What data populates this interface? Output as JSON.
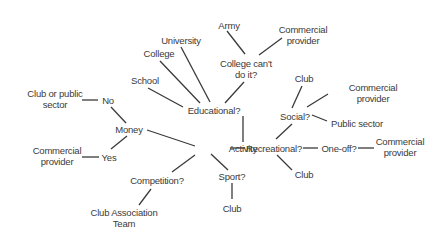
{
  "diagram": {
    "type": "mind-map",
    "root": "Activity",
    "nodes": {
      "activity": {
        "label": "Activity",
        "x": 243,
        "y": 148
      },
      "educational": {
        "label": "Educational?",
        "x": 214,
        "y": 110
      },
      "school": {
        "label": "School",
        "x": 145,
        "y": 80
      },
      "college": {
        "label": "College",
        "x": 159,
        "y": 53
      },
      "university": {
        "label": "University",
        "x": 181,
        "y": 40
      },
      "college_cant": {
        "label": "College can't\ndo it?",
        "x": 246,
        "y": 69
      },
      "army": {
        "label": "Army",
        "x": 229,
        "y": 25
      },
      "commercial_top": {
        "label": "Commercial\nprovider",
        "x": 303,
        "y": 35
      },
      "money": {
        "label": "Money",
        "x": 129,
        "y": 129
      },
      "no": {
        "label": "No",
        "x": 108,
        "y": 100
      },
      "club_public": {
        "label": "Club or public\nsector",
        "x": 55,
        "y": 99
      },
      "yes": {
        "label": "Yes",
        "x": 109,
        "y": 157
      },
      "commercial_left": {
        "label": "Commercial\nprovider",
        "x": 57,
        "y": 156
      },
      "competition": {
        "label": "Competition?",
        "x": 157,
        "y": 180
      },
      "club_assoc": {
        "label": "Club Association\nTeam",
        "x": 124,
        "y": 218
      },
      "sport": {
        "label": "Sport?",
        "x": 232,
        "y": 176
      },
      "club_sport": {
        "label": "Club",
        "x": 232,
        "y": 208
      },
      "recreational": {
        "label": "Recreational?",
        "x": 274,
        "y": 148
      },
      "club_rec": {
        "label": "Club",
        "x": 304,
        "y": 174
      },
      "oneoff": {
        "label": "One-off?",
        "x": 339,
        "y": 148
      },
      "commercial_right": {
        "label": "Commercial\nprovider",
        "x": 400,
        "y": 147
      },
      "social": {
        "label": "Social?",
        "x": 295,
        "y": 116
      },
      "club_social": {
        "label": "Club",
        "x": 304,
        "y": 78
      },
      "commercial_social": {
        "label": "Commercial provider",
        "x": 373,
        "y": 93
      },
      "public_sector": {
        "label": "Public sector",
        "x": 357,
        "y": 123
      }
    },
    "edges": [
      {
        "from": "activity",
        "to": "educational",
        "x1": 243,
        "y1": 142,
        "x2": 243,
        "y2": 116
      },
      {
        "from": "educational",
        "to": "school",
        "x1": 183,
        "y1": 107,
        "x2": 148,
        "y2": 88
      },
      {
        "from": "educational",
        "to": "college",
        "x1": 200,
        "y1": 103,
        "x2": 160,
        "y2": 61
      },
      {
        "from": "educational",
        "to": "university",
        "x1": 210,
        "y1": 102,
        "x2": 181,
        "y2": 47
      },
      {
        "from": "educational",
        "to": "college_cant",
        "x1": 225,
        "y1": 103,
        "x2": 244,
        "y2": 82
      },
      {
        "from": "college_cant",
        "to": "army",
        "x1": 245,
        "y1": 54,
        "x2": 227,
        "y2": 31
      },
      {
        "from": "college_cant",
        "to": "commercial_top",
        "x1": 259,
        "y1": 55,
        "x2": 282,
        "y2": 38
      },
      {
        "from": "activity",
        "to": "money",
        "x1": 195,
        "y1": 146,
        "x2": 147,
        "y2": 130
      },
      {
        "from": "money",
        "to": "no",
        "x1": 126,
        "y1": 123,
        "x2": 111,
        "y2": 107
      },
      {
        "from": "no",
        "to": "club_public",
        "x1": 98,
        "y1": 100,
        "x2": 82,
        "y2": 100
      },
      {
        "from": "money",
        "to": "yes",
        "x1": 127,
        "y1": 136,
        "x2": 111,
        "y2": 149
      },
      {
        "from": "yes",
        "to": "commercial_left",
        "x1": 99,
        "y1": 157,
        "x2": 82,
        "y2": 157
      },
      {
        "from": "activity",
        "to": "competition",
        "x1": 195,
        "y1": 155,
        "x2": 172,
        "y2": 172
      },
      {
        "from": "competition",
        "to": "club_assoc",
        "x1": 151,
        "y1": 189,
        "x2": 139,
        "y2": 205
      },
      {
        "from": "activity",
        "to": "sport",
        "x1": 211,
        "y1": 154,
        "x2": 228,
        "y2": 170
      },
      {
        "from": "sport",
        "to": "club_sport",
        "x1": 232,
        "y1": 183,
        "x2": 232,
        "y2": 199
      },
      {
        "from": "activity",
        "to": "recreational",
        "x1": 230,
        "y1": 148,
        "x2": 245,
        "y2": 148
      },
      {
        "from": "recreational",
        "to": "club_rec",
        "x1": 277,
        "y1": 155,
        "x2": 292,
        "y2": 170
      },
      {
        "from": "recreational",
        "to": "oneoff",
        "x1": 303,
        "y1": 148,
        "x2": 318,
        "y2": 148
      },
      {
        "from": "oneoff",
        "to": "commercial_right",
        "x1": 358,
        "y1": 148,
        "x2": 374,
        "y2": 148
      },
      {
        "from": "recreational",
        "to": "social",
        "x1": 276,
        "y1": 139,
        "x2": 292,
        "y2": 124
      },
      {
        "from": "social",
        "to": "club_social",
        "x1": 292,
        "y1": 108,
        "x2": 302,
        "y2": 86
      },
      {
        "from": "social",
        "to": "commercial_social",
        "x1": 307,
        "y1": 107,
        "x2": 328,
        "y2": 94
      },
      {
        "from": "social",
        "to": "public_sector",
        "x1": 312,
        "y1": 115,
        "x2": 327,
        "y2": 121
      }
    ]
  }
}
